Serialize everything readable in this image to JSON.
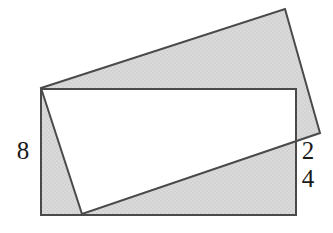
{
  "figure": {
    "type": "geometry-diagram",
    "background_color": "#ffffff",
    "fill_color": "#d8d8d8",
    "stroke_color": "#4a4a4a",
    "stroke_width": 2,
    "labels": [
      {
        "id": "label-8",
        "text": "8",
        "position": "left-edge-middle"
      },
      {
        "id": "label-2",
        "text": "2",
        "position": "right-edge-upper"
      },
      {
        "id": "label-4",
        "text": "4",
        "position": "right-edge-lower"
      }
    ],
    "shapes": {
      "upright_rect": {
        "name": "upright-rectangle",
        "points": "41,89 296,89 296,215 41,215"
      },
      "tilted_rect": {
        "name": "tilted-rectangle",
        "points": "41,88 285,9 320,133 82,214"
      },
      "white_overlap": {
        "name": "white-overlap-region",
        "points": "41,89 296,89 296,141 82,214 41,89"
      }
    }
  }
}
